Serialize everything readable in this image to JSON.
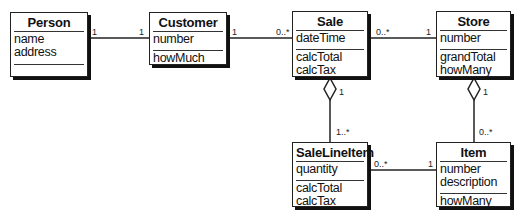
{
  "diagram": {
    "type": "UML class diagram",
    "classes": {
      "person": {
        "name": "Person",
        "attributes": [
          "name",
          "address"
        ],
        "operations": []
      },
      "customer": {
        "name": "Customer",
        "attributes": [
          "number"
        ],
        "operations": [
          "howMuch"
        ]
      },
      "sale": {
        "name": "Sale",
        "attributes": [
          "dateTime"
        ],
        "operations": [
          "calcTotal",
          "calcTax"
        ]
      },
      "store": {
        "name": "Store",
        "attributes": [
          "number"
        ],
        "operations": [
          "grandTotal",
          "howMany"
        ]
      },
      "saleLineItem": {
        "name": "SaleLineItem",
        "attributes": [
          "quantity"
        ],
        "operations": [
          "calcTotal",
          "calcTax"
        ]
      },
      "item": {
        "name": "Item",
        "attributes": [
          "number",
          "description"
        ],
        "operations": [
          "howMany"
        ]
      }
    },
    "associations": {
      "person_customer": {
        "from": "Person",
        "to": "Customer",
        "kind": "association",
        "from_mult": "1",
        "to_mult": "1"
      },
      "customer_sale": {
        "from": "Customer",
        "to": "Sale",
        "kind": "association",
        "from_mult": "1",
        "to_mult": "0..*"
      },
      "sale_store": {
        "from": "Sale",
        "to": "Store",
        "kind": "association",
        "from_mult": "0..*",
        "to_mult": "1"
      },
      "sale_salelineitem": {
        "from": "Sale",
        "to": "SaleLineItem",
        "kind": "aggregation",
        "from_mult": "1",
        "to_mult": "1..*"
      },
      "store_item": {
        "from": "Store",
        "to": "Item",
        "kind": "aggregation",
        "from_mult": "1",
        "to_mult": "0..*"
      },
      "salelineitem_item": {
        "from": "SaleLineItem",
        "to": "Item",
        "kind": "association",
        "from_mult": "0..*",
        "to_mult": "1"
      }
    }
  }
}
